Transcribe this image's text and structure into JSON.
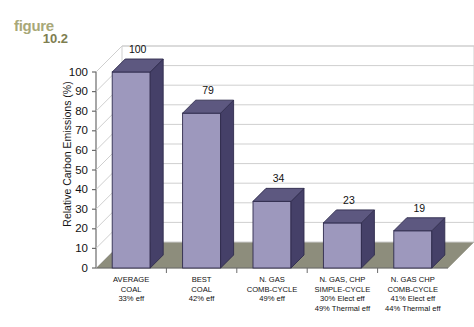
{
  "figure": {
    "word": "figure",
    "number": "10.2"
  },
  "chart_data": {
    "type": "bar",
    "title": "",
    "xlabel": "",
    "ylabel": "Relative Carbon Emissions (%)",
    "ylim": [
      0,
      100
    ],
    "yticks": [
      0,
      10,
      20,
      30,
      40,
      50,
      60,
      70,
      80,
      90,
      100
    ],
    "grid": true,
    "legend": false,
    "categories": [
      "AVERAGE COAL",
      "BEST COAL",
      "N. GAS COMB-CYCLE",
      "N. GAS, CHP SIMPLE-CYCLE",
      "N. GAS CHP COMB-CYCLE"
    ],
    "values": [
      100,
      79,
      34,
      23,
      19
    ],
    "data_labels": [
      "100",
      "79",
      "34",
      "23",
      "19"
    ],
    "category_lines": [
      [
        "AVERAGE",
        "COAL",
        "33% eff"
      ],
      [
        "BEST",
        "COAL",
        "42% eff"
      ],
      [
        "N. GAS",
        "COMB-CYCLE",
        "49% eff"
      ],
      [
        "N. GAS, CHP",
        "SIMPLE-CYCLE",
        "30% Elect eff",
        "49% Thermal eff"
      ],
      [
        "N. GAS CHP",
        "COMB-CYCLE",
        "41% Elect eff",
        "44% Thermal eff"
      ]
    ],
    "colors": {
      "bar_front": "#9d98bd",
      "bar_side": "#454068",
      "bar_top": "#5d5880",
      "floor": "#8d8d7c",
      "gridline": "#cfcfcf",
      "axis": "#6b6b6b",
      "plot_background": "#ffffff",
      "figure_label": "#a8a878"
    }
  }
}
